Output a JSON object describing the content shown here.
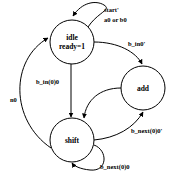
{
  "diagram": {
    "type": "state-machine",
    "colors": {
      "stroke": "#000000",
      "background": "#ffffff",
      "text": "#000000"
    },
    "states": [
      {
        "id": "idle",
        "label": "idle",
        "output": "ready=1"
      },
      {
        "id": "add",
        "label": "add"
      },
      {
        "id": "shift",
        "label": "shift"
      }
    ],
    "transitions": [
      {
        "from": "idle",
        "to": "idle",
        "label_line1": "start'",
        "label_line2": "a0 or b0"
      },
      {
        "from": "idle",
        "to": "add",
        "label": "b_in0'"
      },
      {
        "from": "idle",
        "to": "shift",
        "label": "b_in(0)0"
      },
      {
        "from": "add",
        "to": "shift",
        "label": ""
      },
      {
        "from": "shift",
        "to": "add",
        "label": "b_next(0)0'"
      },
      {
        "from": "shift",
        "to": "shift",
        "label": "b_next(0)0"
      },
      {
        "from": "shift",
        "to": "idle",
        "label": "n0"
      }
    ]
  }
}
